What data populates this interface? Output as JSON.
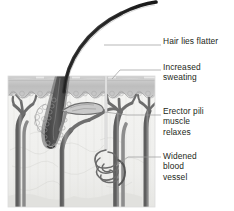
{
  "figure": {
    "kind": "anatomical-cross-section",
    "background_color": "#ffffff"
  },
  "labels": [
    {
      "id": "hair",
      "text": "Hair lies flatter",
      "name": "label-hair-lies-flatter"
    },
    {
      "id": "sweating",
      "text": "Increased\nsweating",
      "name": "label-increased-sweating"
    },
    {
      "id": "erector",
      "text": "Erector pili\nmuscle\nrelaxes",
      "name": "label-erector-pili-muscle-relaxes"
    },
    {
      "id": "vessel",
      "text": "Widened\nblood\nvessel",
      "name": "label-widened-blood-vessel"
    }
  ],
  "colors": {
    "text": "#231f20",
    "leader_line": "#9a9a9a",
    "hair_shaft": "#3a3a3a",
    "epidermis": "#b9b9b9",
    "epidermis_top": "#cfcfcf",
    "dermis": "#f0f0ee",
    "hypodermis": "#e4e4e2",
    "vessel_dark": "#6f6f6f",
    "vessel_mid": "#8d8d8d",
    "follicle": "#4a4a4a",
    "gland_outline": "#9d9d9d"
  },
  "structures": [
    {
      "name": "hair-shaft",
      "label": "hair shaft"
    },
    {
      "name": "epidermis-layer",
      "label": "epidermis"
    },
    {
      "name": "dermis-layer",
      "label": "dermis"
    },
    {
      "name": "hypodermis-layer",
      "label": "hypodermis"
    },
    {
      "name": "hair-follicle",
      "label": "hair follicle"
    },
    {
      "name": "sebaceous-gland",
      "label": "sebaceous gland"
    },
    {
      "name": "erector-pili-muscle",
      "label": "erector pili muscle"
    },
    {
      "name": "sweat-duct",
      "label": "sweat duct"
    },
    {
      "name": "sweat-gland-coil",
      "label": "sweat gland"
    },
    {
      "name": "blood-vessel-left",
      "label": "blood vessel"
    },
    {
      "name": "blood-vessel-center",
      "label": "blood vessel"
    },
    {
      "name": "blood-vessel-right",
      "label": "blood vessel"
    },
    {
      "name": "blood-vessel-far-right",
      "label": "blood vessel"
    }
  ]
}
